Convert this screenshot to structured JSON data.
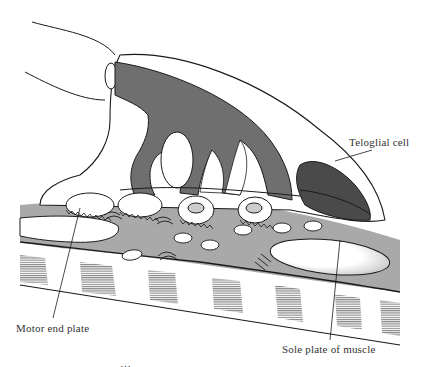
{
  "figure": {
    "colors": {
      "background": "#ffffff",
      "outline": "#1a1a1a",
      "nerve_terminal": "#6f6f6f",
      "teloglial_nucleus": "#4a4a4a",
      "sole_plate": "#a9a9a9",
      "muscle_striation": "#555555"
    }
  },
  "labels": {
    "teloglial_cell": "Teloglial cell",
    "motor_end_plate": "Motor end plate",
    "sole_plate": "Sole plate of muscle"
  },
  "caption": {
    "clipped_text": "…"
  }
}
